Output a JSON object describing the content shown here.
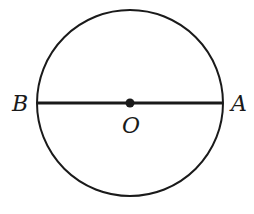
{
  "diagram": {
    "circle": {
      "cx": 130,
      "cy": 103,
      "r": 93,
      "stroke": "#1a1a1a"
    },
    "diameter": {
      "x1": 37,
      "y1": 103,
      "x2": 223,
      "y2": 103
    },
    "center_point": {
      "cx": 130,
      "cy": 103,
      "r": 4
    },
    "labels": {
      "A": "A",
      "B": "B",
      "O": "O"
    }
  }
}
